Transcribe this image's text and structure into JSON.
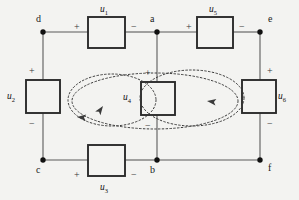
{
  "figure": {
    "type": "circuit-diagram",
    "background_color": "#f3f3f1",
    "wire_color": "#5a5a5a",
    "box_color": "#2b2b2b",
    "loop_color": "#3a3a3a"
  },
  "nodes": [
    {
      "id": "d",
      "label": "d",
      "x": 43,
      "y": 32,
      "label_x": 36,
      "label_y": 14
    },
    {
      "id": "a",
      "label": "a",
      "x": 157,
      "y": 32,
      "label_x": 150,
      "label_y": 14
    },
    {
      "id": "e",
      "label": "e",
      "x": 260,
      "y": 32,
      "label_x": 268,
      "label_y": 14
    },
    {
      "id": "c",
      "label": "c",
      "x": 43,
      "y": 160,
      "label_x": 36,
      "label_y": 165
    },
    {
      "id": "b",
      "label": "b",
      "x": 157,
      "y": 160,
      "label_x": 150,
      "label_y": 165
    },
    {
      "id": "f",
      "label": "f",
      "x": 260,
      "y": 160,
      "label_x": 268,
      "label_y": 163
    }
  ],
  "elements": [
    {
      "id": "u1",
      "name": "u",
      "subscript": "1",
      "orientation": "horizontal",
      "box": {
        "x": 88,
        "y": 17,
        "w": 37,
        "h": 31
      },
      "label_x": 100,
      "label_y": 5,
      "plus": {
        "sign": "+",
        "x": 74,
        "y": 22
      },
      "minus": {
        "sign": "−",
        "x": 131,
        "y": 22
      }
    },
    {
      "id": "u5",
      "name": "u",
      "subscript": "5",
      "orientation": "horizontal",
      "box": {
        "x": 197,
        "y": 17,
        "w": 36,
        "h": 31
      },
      "label_x": 209,
      "label_y": 5,
      "plus": {
        "sign": "+",
        "x": 186,
        "y": 22
      },
      "minus": {
        "sign": "−",
        "x": 239,
        "y": 22
      }
    },
    {
      "id": "u2",
      "name": "u",
      "subscript": "2",
      "orientation": "vertical",
      "box": {
        "x": 26,
        "y": 80,
        "w": 34,
        "h": 33
      },
      "label_x": 7,
      "label_y": 92,
      "plus": {
        "sign": "+",
        "x": 29,
        "y": 66
      },
      "minus": {
        "sign": "−",
        "x": 29,
        "y": 119
      }
    },
    {
      "id": "u6",
      "name": "u",
      "subscript": "6",
      "orientation": "vertical",
      "box": {
        "x": 242,
        "y": 80,
        "w": 34,
        "h": 33
      },
      "label_x": 278,
      "label_y": 92,
      "plus": {
        "sign": "+",
        "x": 267,
        "y": 66
      },
      "minus": {
        "sign": "−",
        "x": 267,
        "y": 119
      }
    },
    {
      "id": "u4",
      "name": "u",
      "subscript": "4",
      "orientation": "vertical",
      "box": {
        "x": 141,
        "y": 82,
        "w": 34,
        "h": 33
      },
      "label_x": 123,
      "label_y": 93,
      "plus": {
        "sign": "+",
        "x": 145,
        "y": 68
      },
      "minus": {
        "sign": "−",
        "x": 145,
        "y": 121
      }
    },
    {
      "id": "u3",
      "name": "u",
      "subscript": "3",
      "orientation": "horizontal",
      "box": {
        "x": 88,
        "y": 145,
        "w": 37,
        "h": 31
      },
      "label_x": 100,
      "label_y": 183,
      "plus": {
        "sign": "+",
        "x": 74,
        "y": 170
      },
      "minus": {
        "sign": "−",
        "x": 131,
        "y": 170
      }
    }
  ],
  "wires": [
    {
      "id": "d-u1",
      "x1": 43,
      "y1": 32,
      "x2": 88,
      "y2": 32
    },
    {
      "id": "u1-a",
      "x1": 125,
      "y1": 32,
      "x2": 157,
      "y2": 32
    },
    {
      "id": "a-u5",
      "x1": 157,
      "y1": 32,
      "x2": 197,
      "y2": 32
    },
    {
      "id": "u5-e",
      "x1": 233,
      "y1": 32,
      "x2": 260,
      "y2": 32
    },
    {
      "id": "d-u2",
      "x1": 43,
      "y1": 32,
      "x2": 43,
      "y2": 80
    },
    {
      "id": "u2-c",
      "x1": 43,
      "y1": 113,
      "x2": 43,
      "y2": 160
    },
    {
      "id": "e-u6",
      "x1": 260,
      "y1": 32,
      "x2": 260,
      "y2": 80
    },
    {
      "id": "u6-f",
      "x1": 260,
      "y1": 113,
      "x2": 260,
      "y2": 160
    },
    {
      "id": "a-u4",
      "x1": 157,
      "y1": 32,
      "x2": 157,
      "y2": 82
    },
    {
      "id": "u4-b",
      "x1": 157,
      "y1": 115,
      "x2": 157,
      "y2": 160
    },
    {
      "id": "c-u3",
      "x1": 43,
      "y1": 160,
      "x2": 88,
      "y2": 160
    },
    {
      "id": "u3-b",
      "x1": 125,
      "y1": 160,
      "x2": 157,
      "y2": 160
    },
    {
      "id": "b-f",
      "x1": 157,
      "y1": 160,
      "x2": 260,
      "y2": 160
    }
  ],
  "mesh_loops": [
    {
      "id": "left-mesh-loop",
      "shape": "ellipse",
      "cx": 112,
      "cy": 100,
      "rx": 44,
      "ry": 26,
      "arrow": {
        "x": 103,
        "y": 106,
        "angle": -55
      }
    },
    {
      "id": "right-mesh-loop",
      "shape": "ellipse",
      "cx": 192,
      "cy": 98,
      "rx": 52,
      "ry": 28,
      "arrow": {
        "x": 207,
        "y": 101,
        "angle": 188
      }
    },
    {
      "id": "outer-mesh-loop",
      "shape": "ellipse",
      "cx": 155,
      "cy": 101,
      "rx": 83,
      "ry": 28,
      "arrow": {
        "x": 77,
        "y": 117,
        "angle": 185
      }
    }
  ]
}
